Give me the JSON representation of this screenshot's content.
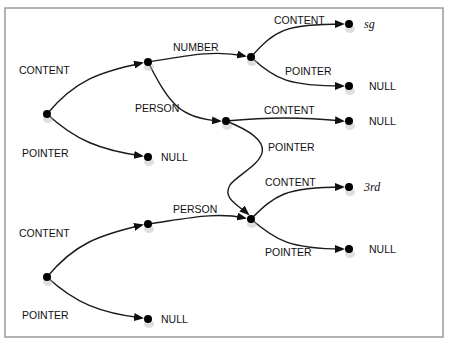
{
  "diagram": {
    "title": "",
    "frame": {
      "x": 5,
      "y": 8,
      "w": 438,
      "h": 329
    },
    "nodes": [
      {
        "id": "r1",
        "x": 47,
        "y": 114
      },
      {
        "id": "n1",
        "x": 148,
        "y": 62
      },
      {
        "id": "n1null",
        "x": 148,
        "y": 157,
        "label": "NULL"
      },
      {
        "id": "n2",
        "x": 251,
        "y": 57
      },
      {
        "id": "sg",
        "x": 349,
        "y": 24,
        "label": "sg",
        "italic": true
      },
      {
        "id": "n2null",
        "x": 349,
        "y": 86,
        "label": "NULL"
      },
      {
        "id": "n3",
        "x": 226,
        "y": 121
      },
      {
        "id": "n3null",
        "x": 349,
        "y": 121,
        "label": "NULL"
      },
      {
        "id": "n4",
        "x": 251,
        "y": 219
      },
      {
        "id": "third",
        "x": 349,
        "y": 187,
        "label": "3rd",
        "italic": true
      },
      {
        "id": "n4null",
        "x": 349,
        "y": 249,
        "label": "NULL"
      },
      {
        "id": "r2",
        "x": 47,
        "y": 277
      },
      {
        "id": "n5",
        "x": 148,
        "y": 224
      },
      {
        "id": "n5null",
        "x": 148,
        "y": 319,
        "label": "NULL"
      }
    ],
    "edges": [
      {
        "from": "r1",
        "to": "n1",
        "label": "CONTENT",
        "path": "M47,114 C75,80 100,72 142,63",
        "lx": 19,
        "ly": 74
      },
      {
        "from": "r1",
        "to": "n1null",
        "label": "POINTER",
        "path": "M47,114 C75,140 100,150 142,156",
        "lx": 22,
        "ly": 157
      },
      {
        "from": "n1",
        "to": "n2",
        "label": "NUMBER",
        "path": "M148,62 C190,55 215,50 245,56",
        "lx": 173,
        "ly": 51
      },
      {
        "from": "n1",
        "to": "n3",
        "label": "PERSON",
        "path": "M148,62 C170,105 180,118 220,121",
        "lx": 135,
        "ly": 112
      },
      {
        "from": "n2",
        "to": "sg",
        "label": "CONTENT",
        "path": "M251,57 C275,30 285,24 343,24",
        "lx": 274,
        "ly": 24
      },
      {
        "from": "n2",
        "to": "n2null",
        "label": "POINTER",
        "path": "M251,57 C275,80 290,86 343,86",
        "lx": 285,
        "ly": 75
      },
      {
        "from": "n3",
        "to": "n3null",
        "label": "CONTENT",
        "path": "M226,121 C270,117 300,117 343,121",
        "lx": 264,
        "ly": 114
      },
      {
        "from": "n3",
        "to": "n4",
        "label": "POINTER",
        "path": "M226,121 C300,150 240,170 230,185 C222,198 238,205 248,214",
        "lx": 268,
        "ly": 151
      },
      {
        "from": "n4",
        "to": "third",
        "label": "CONTENT",
        "path": "M251,219 C275,195 285,187 343,187",
        "lx": 265,
        "ly": 186
      },
      {
        "from": "n4",
        "to": "n4null",
        "label": "POINTER",
        "path": "M251,219 C275,240 290,249 343,249",
        "lx": 265,
        "ly": 256
      },
      {
        "from": "r2",
        "to": "n5",
        "label": "PERSON",
        "path": "M148,224 C190,218 215,212 245,218",
        "lx": 173,
        "ly": 213
      },
      {
        "from": "r2",
        "to": "n5",
        "label": "CONTENT",
        "path": "M47,277 C75,243 100,235 142,225",
        "lx": 19,
        "ly": 237
      },
      {
        "from": "r2",
        "to": "n5null",
        "label": "POINTER",
        "path": "M47,277 C75,303 100,313 142,318",
        "lx": 22,
        "ly": 319
      }
    ]
  }
}
